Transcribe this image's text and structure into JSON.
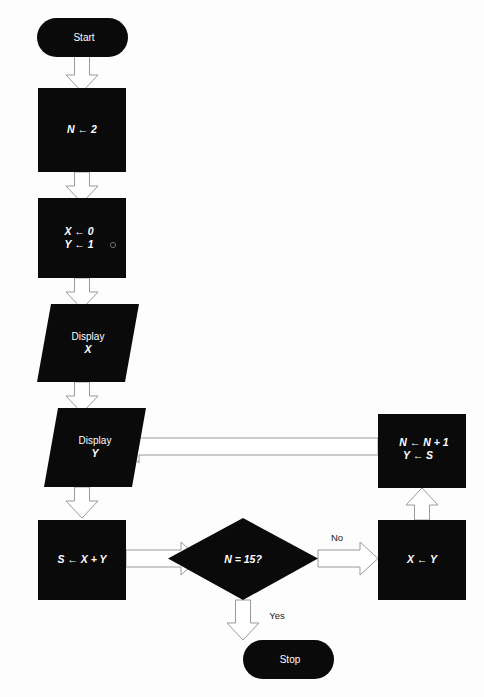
{
  "diagram": {
    "canvas": {
      "width": 484,
      "height": 697
    },
    "colors": {
      "node_fill": "#0a0a0a",
      "node_text": "#ffffff",
      "arrow_fill": "#ffffff",
      "arrow_stroke": "#9a9a9a",
      "background": "#fdfdfd",
      "edge_label_text": "#1a1a1a"
    }
  },
  "nodes": {
    "start": {
      "label": "Start",
      "shape": "terminator"
    },
    "init_n": {
      "label": "N ← 2",
      "shape": "process"
    },
    "init_xy_line1": {
      "label": "X ← 0",
      "shape": "process"
    },
    "init_xy_line2": {
      "label": "Y ← 1",
      "shape": "process"
    },
    "display_x_line1": {
      "label": "Display",
      "shape": "input-output"
    },
    "display_x_line2": {
      "label": "X",
      "shape": "input-output"
    },
    "display_y_line1": {
      "label": "Display",
      "shape": "input-output"
    },
    "display_y_line2": {
      "label": "Y",
      "shape": "input-output"
    },
    "sum": {
      "label": "S ← X + Y",
      "shape": "process"
    },
    "decision": {
      "label": "N = 15?",
      "shape": "decision"
    },
    "assign_x": {
      "label": "X ← Y",
      "shape": "process"
    },
    "increment_line1": {
      "label": "N ← N + 1",
      "shape": "process"
    },
    "increment_line2": {
      "label": "Y ← S",
      "shape": "process"
    },
    "stop": {
      "label": "Stop",
      "shape": "terminator"
    }
  },
  "edge_labels": {
    "no": "No",
    "yes": "Yes"
  }
}
